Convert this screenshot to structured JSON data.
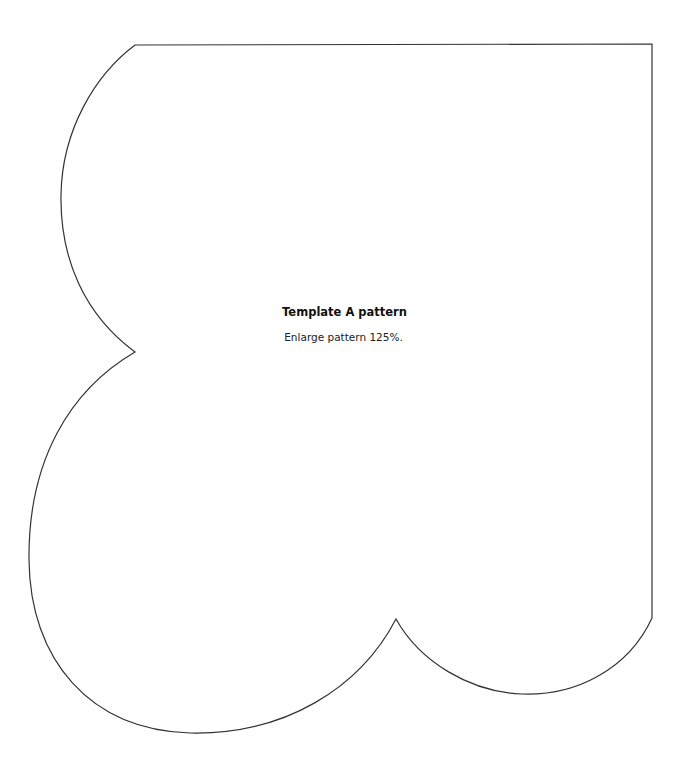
{
  "template": {
    "title": "Template A pattern",
    "instruction": "Enlarge pattern 125%.",
    "outline_color": "#333333",
    "background": "#ffffff"
  }
}
